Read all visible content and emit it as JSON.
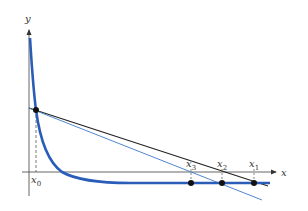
{
  "diagram": {
    "axes": {
      "x_label": "x",
      "y_label": "y"
    },
    "points": [
      {
        "name": "x0",
        "label": "x",
        "sub": "0"
      },
      {
        "name": "x1",
        "label": "x",
        "sub": "1"
      },
      {
        "name": "x2",
        "label": "x",
        "sub": "2"
      },
      {
        "name": "x3",
        "label": "x",
        "sub": "3"
      }
    ],
    "colors": {
      "curve": "#2a5db8",
      "tangent_black": "#222222",
      "tangent_blue": "#3c78c8",
      "axis": "#555555",
      "point": "#111111"
    }
  }
}
